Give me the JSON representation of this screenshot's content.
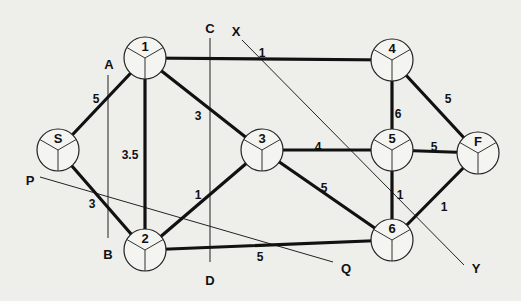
{
  "diagram": {
    "type": "network-flow-graph",
    "nodes": [
      {
        "id": "S",
        "label": "S",
        "x": 58,
        "y": 150
      },
      {
        "id": "1",
        "label": "1",
        "x": 145,
        "y": 58
      },
      {
        "id": "2",
        "label": "2",
        "x": 145,
        "y": 250
      },
      {
        "id": "3",
        "label": "3",
        "x": 262,
        "y": 150
      },
      {
        "id": "4",
        "label": "4",
        "x": 392,
        "y": 60
      },
      {
        "id": "5",
        "label": "5",
        "x": 392,
        "y": 150
      },
      {
        "id": "F",
        "label": "F",
        "x": 478,
        "y": 153
      },
      {
        "id": "6",
        "label": "6",
        "x": 392,
        "y": 240
      }
    ],
    "edges": [
      {
        "from": "S",
        "to": "1",
        "weight": "5",
        "label_x": 96,
        "label_y": 100
      },
      {
        "from": "S",
        "to": "2",
        "weight": "3",
        "label_x": 92,
        "label_y": 205
      },
      {
        "from": "1",
        "to": "2",
        "weight": "3.5",
        "label_x": 130,
        "label_y": 156
      },
      {
        "from": "1",
        "to": "4",
        "weight": "1",
        "label_x": 262,
        "label_y": 54
      },
      {
        "from": "1",
        "to": "3",
        "weight": "3",
        "label_x": 198,
        "label_y": 117
      },
      {
        "from": "2",
        "to": "3",
        "weight": "1",
        "label_x": 198,
        "label_y": 196
      },
      {
        "from": "2",
        "to": "6",
        "weight": "5",
        "label_x": 260,
        "label_y": 258
      },
      {
        "from": "3",
        "to": "5",
        "weight": "4",
        "label_x": 318,
        "label_y": 148
      },
      {
        "from": "3",
        "to": "6",
        "weight": "5",
        "label_x": 324,
        "label_y": 189
      },
      {
        "from": "4",
        "to": "5",
        "weight": "6",
        "label_x": 398,
        "label_y": 115
      },
      {
        "from": "4",
        "to": "F",
        "weight": "5",
        "label_x": 448,
        "label_y": 100
      },
      {
        "from": "5",
        "to": "F",
        "weight": "5",
        "label_x": 434,
        "label_y": 148
      },
      {
        "from": "5",
        "to": "6",
        "weight": "1",
        "label_x": 400,
        "label_y": 196
      },
      {
        "from": "6",
        "to": "F",
        "weight": "1",
        "label_x": 444,
        "label_y": 208
      }
    ],
    "cut_lines": [
      {
        "id": "AB",
        "start_label": "A",
        "end_label": "B",
        "x1": 108,
        "y1": 75,
        "x2": 108,
        "y2": 238,
        "start_lx": 109,
        "start_ly": 66,
        "end_lx": 108,
        "end_ly": 256
      },
      {
        "id": "CD",
        "start_label": "C",
        "end_label": "D",
        "x1": 210,
        "y1": 38,
        "x2": 210,
        "y2": 262,
        "start_lx": 210,
        "start_ly": 30,
        "end_lx": 210,
        "end_ly": 282
      },
      {
        "id": "XY",
        "start_label": "X",
        "end_label": "Y",
        "x1": 242,
        "y1": 40,
        "x2": 464,
        "y2": 265,
        "start_lx": 236,
        "start_ly": 33,
        "end_lx": 476,
        "end_ly": 270
      },
      {
        "id": "PQ",
        "start_label": "P",
        "end_label": "Q",
        "x1": 40,
        "y1": 177,
        "x2": 333,
        "y2": 262,
        "start_lx": 30,
        "start_ly": 182,
        "end_lx": 346,
        "end_ly": 270
      }
    ]
  }
}
